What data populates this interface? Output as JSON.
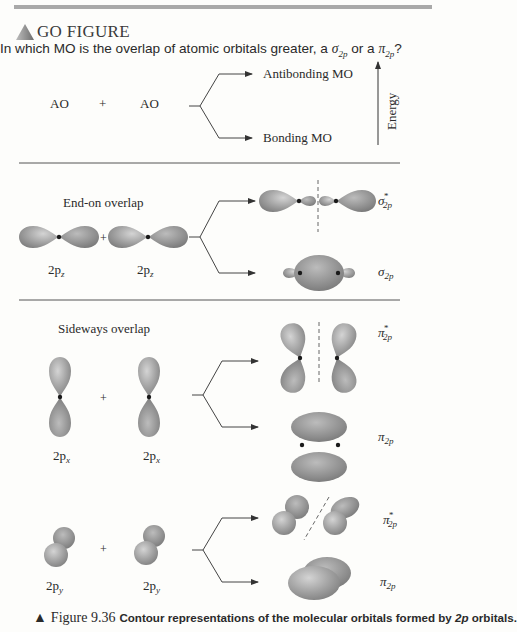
{
  "header": {
    "section_label": "GO FIGURE",
    "question_prefix": "In which MO is the overlap of atomic orbitals greater, a ",
    "sigma_symbol": "σ",
    "sigma_sub": "2p",
    "question_or": " or a ",
    "pi_symbol": "π",
    "pi_sub": "2p",
    "question_suffix": "?"
  },
  "scheme": {
    "ao_left": "AO",
    "plus": "+",
    "ao_right": "AO",
    "antibonding": "Antibonding MO",
    "bonding": "Bonding MO",
    "energy_axis": "Energy"
  },
  "panels": [
    {
      "title": "End-on overlap",
      "orbital_label": "2p",
      "orbital_sub": "z",
      "plus": "+",
      "antibonding_symbol": "σ",
      "antibonding_sub": "2p",
      "antibonding_sup": "*",
      "bonding_symbol": "σ",
      "bonding_sub": "2p"
    },
    {
      "title": "Sideways overlap",
      "orbital_label": "2p",
      "orbital_sub": "x",
      "plus": "+",
      "antibonding_symbol": "π",
      "antibonding_sub": "2p",
      "antibonding_sup": "*",
      "bonding_symbol": "π",
      "bonding_sub": "2p"
    },
    {
      "title": "",
      "orbital_label": "2p",
      "orbital_sub": "y",
      "plus": "+",
      "antibonding_symbol": "π",
      "antibonding_sub": "2p",
      "antibonding_sup": "*",
      "bonding_symbol": "π",
      "bonding_sub": "2p"
    }
  ],
  "caption": {
    "marker": "▲",
    "figure_number": "Figure 9.36",
    "text": "Contour representations of the molecular orbitals formed by ",
    "text_italic": "2p",
    "text_end": " orbitals."
  },
  "colors": {
    "orbital_fill": "#9a9a9a",
    "orbital_highlight": "#cfcfcf",
    "divider": "#555555",
    "nucleus": "#1a1a1a"
  }
}
